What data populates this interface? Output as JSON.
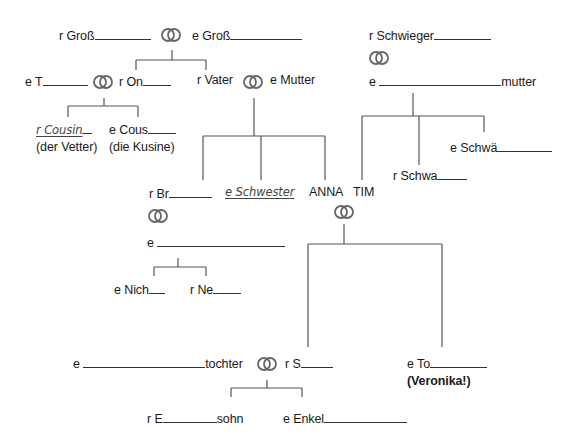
{
  "diagram": {
    "grandparents": {
      "grandfather": "r Groß",
      "grandmother": "e Groß"
    },
    "parents_gen": {
      "aunt": "e T",
      "uncle": "r On",
      "father": "r Vater",
      "mother": "e Mutter",
      "father_in_law": "r Schwieger",
      "mother_in_law_prefix": "e",
      "mother_in_law_suffix": "mutter"
    },
    "cousins": {
      "cousin_m": "r Cousin",
      "cousin_m_alt": "(der Vetter)",
      "cousin_f": "e Cous",
      "cousin_f_alt": "(die Kusine)"
    },
    "siblings": {
      "brother": "r Br",
      "sister": "e Schwester",
      "anna": "ANNA",
      "tim": "TIM",
      "brother_in_law": "r Schwa",
      "sister_in_law": "e Schwä",
      "brother_wife_prefix": "e"
    },
    "nieces": {
      "niece": "e Nich",
      "nephew": "r Ne"
    },
    "children": {
      "daughter_in_law_prefix": "e",
      "daughter_in_law_suffix": "tochter",
      "son": "r S",
      "daughter": "e To",
      "daughter_note": "(Veronika!)"
    },
    "grandchildren": {
      "grandson_prefix": "r E",
      "grandson_suffix": "sohn",
      "granddaughter": "e Enkel"
    },
    "icons": {
      "marriage": "wedding-rings-icon"
    }
  }
}
